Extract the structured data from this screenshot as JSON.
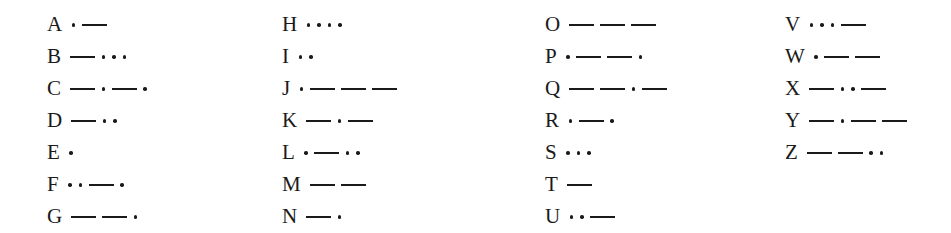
{
  "columns": [
    [
      {
        "letter": "A",
        "code": ".-"
      },
      {
        "letter": "B",
        "code": "-..."
      },
      {
        "letter": "C",
        "code": "-.-."
      },
      {
        "letter": "D",
        "code": "-.."
      },
      {
        "letter": "E",
        "code": "."
      },
      {
        "letter": "F",
        "code": "..-."
      },
      {
        "letter": "G",
        "code": "--."
      }
    ],
    [
      {
        "letter": "H",
        "code": "...."
      },
      {
        "letter": "I",
        "code": ".."
      },
      {
        "letter": "J",
        "code": ".---"
      },
      {
        "letter": "K",
        "code": "-.-"
      },
      {
        "letter": "L",
        "code": ".-.."
      },
      {
        "letter": "M",
        "code": "--"
      },
      {
        "letter": "N",
        "code": "-."
      }
    ],
    [
      {
        "letter": "O",
        "code": "---"
      },
      {
        "letter": "P",
        "code": ".--."
      },
      {
        "letter": "Q",
        "code": "--.-"
      },
      {
        "letter": "R",
        "code": ".-."
      },
      {
        "letter": "S",
        "code": "..."
      },
      {
        "letter": "T",
        "code": "-"
      },
      {
        "letter": "U",
        "code": "..-"
      }
    ],
    [
      {
        "letter": "V",
        "code": "...-"
      },
      {
        "letter": "W",
        "code": ".--"
      },
      {
        "letter": "X",
        "code": "-..-"
      },
      {
        "letter": "Y",
        "code": "-.--"
      },
      {
        "letter": "Z",
        "code": "--.."
      }
    ]
  ],
  "layout": {
    "column_left_px": [
      47,
      282,
      545,
      785
    ],
    "ink_color": "#1a1a1a"
  }
}
